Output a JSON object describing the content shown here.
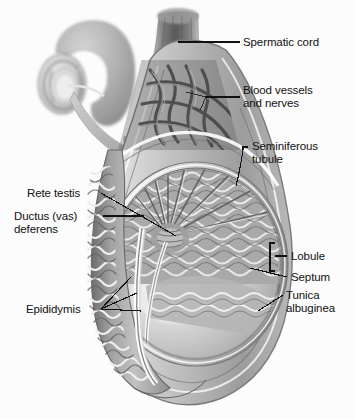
{
  "figure": {
    "kind": "anatomical-illustration",
    "style": "grayscale medical illustration",
    "background_color": "#fcfcfc",
    "text_color": "#111111",
    "leader_color": "#111111"
  },
  "inset": {
    "name": "orientation-inset",
    "description": "Small grayscale whole-organ view at upper left with a curved arrow pointing down-right to the magnified cutaway",
    "arrow": "curved-arrow"
  },
  "labels": {
    "spermatic_cord": "Spermatic cord",
    "blood_vessels_line1": "Blood vessels",
    "blood_vessels_line2": "and nerves",
    "seminiferous_line1": "Seminiferous",
    "seminiferous_line2": "tubule",
    "rete_testis": "Rete testis",
    "ductus_line1": "Ductus (vas)",
    "ductus_line2": "deferens",
    "epididymis": "Epididymis",
    "lobule": "Lobule",
    "septum": "Septum",
    "tunica_line1": "Tunica",
    "tunica_line2": "albuginea"
  },
  "structures": [
    {
      "id": "spermatic-cord",
      "label": "Spermatic cord",
      "side": "right"
    },
    {
      "id": "blood-vessels",
      "label": "Blood vessels and nerves",
      "side": "right"
    },
    {
      "id": "seminiferous-tubule",
      "label": "Seminiferous tubule",
      "side": "right"
    },
    {
      "id": "lobule",
      "label": "Lobule",
      "side": "right"
    },
    {
      "id": "septum",
      "label": "Septum",
      "side": "right"
    },
    {
      "id": "tunica-albuginea",
      "label": "Tunica albuginea",
      "side": "right"
    },
    {
      "id": "rete-testis",
      "label": "Rete testis",
      "side": "left"
    },
    {
      "id": "ductus-deferens",
      "label": "Ductus (vas) deferens",
      "side": "left"
    },
    {
      "id": "epididymis",
      "label": "Epididymis",
      "side": "left"
    }
  ]
}
